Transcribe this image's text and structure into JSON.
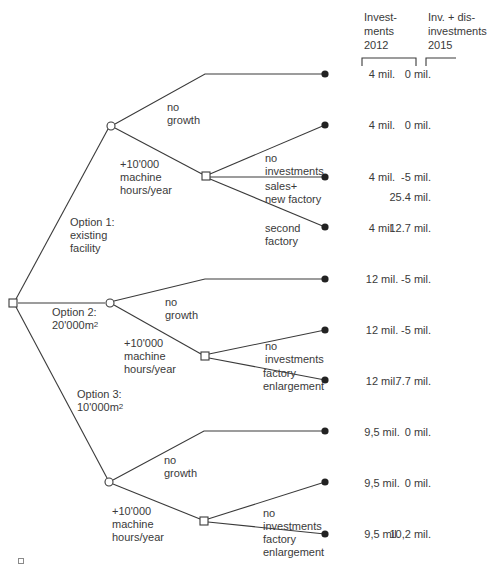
{
  "headers": {
    "investments_2012": "Invest-\nments\n2012",
    "inv_disinv_2015": "Inv. + dis-\ninvestments\n2015"
  },
  "options": [
    {
      "label": "Option 1:\nexisting\nfacility",
      "branches": {
        "no_growth": "no\ngrowth",
        "growth": "+10'000\nmachine\nhours/year"
      },
      "sub_decisions": [
        {
          "label": "no\ninvestments"
        },
        {
          "label": "sales+\nnew factory"
        },
        {
          "label": "second\nfactory"
        }
      ],
      "outcomes": [
        {
          "invest_2012": "4 mil.",
          "inv_2015": "0 mil."
        },
        {
          "invest_2012": "4 mil.",
          "inv_2015": "0 mil."
        },
        {
          "invest_2012": "4 mil.",
          "inv_2015": "-5 mil.",
          "inv_2015_extra": "25.4 mil."
        },
        {
          "invest_2012": "4 mil.",
          "inv_2015": "12.7 mil."
        }
      ]
    },
    {
      "label_line1": "Option 2:",
      "label_line2": "20'000m",
      "label_sup": "2",
      "branches": {
        "no_growth": "no\ngrowth",
        "growth": "+10'000\nmachine\nhours/year"
      },
      "sub_decisions": [
        {
          "label": "no\ninvestments"
        },
        {
          "label": "factory\nenlargement"
        }
      ],
      "outcomes": [
        {
          "invest_2012": "12 mil.",
          "inv_2015": "-5 mil."
        },
        {
          "invest_2012": "12 mil.",
          "inv_2015": "-5 mil."
        },
        {
          "invest_2012": "12 mil.",
          "inv_2015": "7.7 mil."
        }
      ]
    },
    {
      "label_line1": "Option 3:",
      "label_line2": "10'000m",
      "label_sup": "2",
      "branches": {
        "no_growth": "no\ngrowth",
        "growth": "+10'000\nmachine\nhours/year"
      },
      "sub_decisions": [
        {
          "label": "no\ninvestments"
        },
        {
          "label": "factory\nenlargement"
        }
      ],
      "outcomes": [
        {
          "invest_2012": "9,5 mil.",
          "inv_2015": "0 mil."
        },
        {
          "invest_2012": "9,5 mil.",
          "inv_2015": "0 mil."
        },
        {
          "invest_2012": "9,5 mil.",
          "inv_2015": "10,2 mil."
        }
      ]
    }
  ],
  "colors": {
    "line": "#3a3a3a",
    "text": "#3a3a3a",
    "leaf": "#222222",
    "background": "#ffffff"
  }
}
